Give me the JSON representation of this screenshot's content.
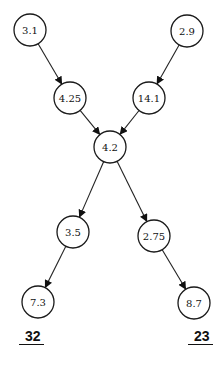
{
  "diagram": {
    "type": "directed-graph",
    "nodes": [
      {
        "id": "n1",
        "label": "3.1",
        "cx": 30,
        "cy": 30,
        "r": 16
      },
      {
        "id": "n2",
        "label": "2.9",
        "cx": 187,
        "cy": 31,
        "r": 16
      },
      {
        "id": "n3",
        "label": "4.25",
        "cx": 70,
        "cy": 98,
        "r": 16
      },
      {
        "id": "n4",
        "label": "14.1",
        "cx": 149,
        "cy": 98,
        "r": 16
      },
      {
        "id": "n5",
        "label": "4.2",
        "cx": 110,
        "cy": 147,
        "r": 16
      },
      {
        "id": "n6",
        "label": "3.5",
        "cx": 73,
        "cy": 232,
        "r": 16
      },
      {
        "id": "n7",
        "label": "2.75",
        "cx": 154,
        "cy": 236,
        "r": 16
      },
      {
        "id": "n8",
        "label": "7.3",
        "cx": 38,
        "cy": 302,
        "r": 16
      },
      {
        "id": "n9",
        "label": "8.7",
        "cx": 194,
        "cy": 303,
        "r": 16
      }
    ],
    "edges": [
      {
        "from": "n1",
        "to": "n3"
      },
      {
        "from": "n2",
        "to": "n4"
      },
      {
        "from": "n3",
        "to": "n5"
      },
      {
        "from": "n4",
        "to": "n5"
      },
      {
        "from": "n5",
        "to": "n6"
      },
      {
        "from": "n5",
        "to": "n7"
      },
      {
        "from": "n6",
        "to": "n8"
      },
      {
        "from": "n7",
        "to": "n9"
      }
    ],
    "totals": [
      {
        "label": "32",
        "x": 19,
        "y": 329
      },
      {
        "label": "23",
        "x": 188,
        "y": 329
      }
    ]
  }
}
